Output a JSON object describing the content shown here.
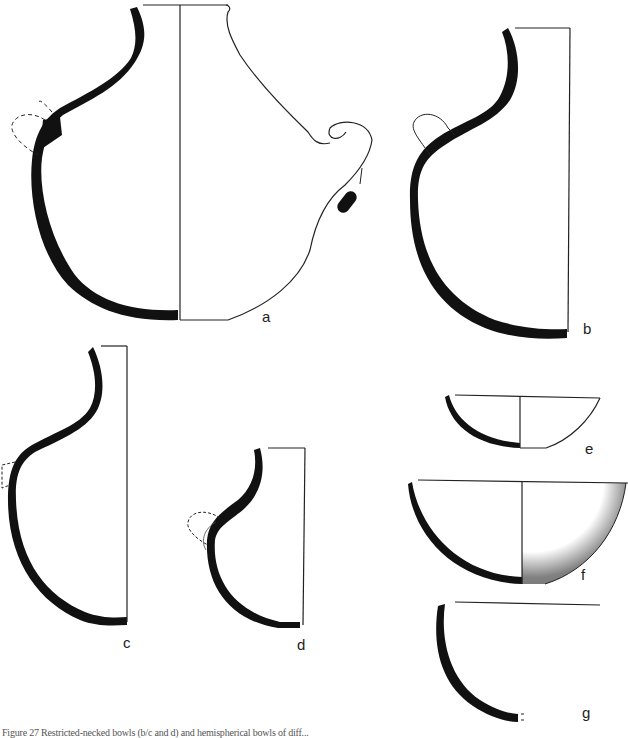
{
  "figure": {
    "caption": "Figure 27 Restricted-necked bowls (b/c and d) and hemispherical bowls of diff...",
    "vessels": [
      {
        "id": "a",
        "label": "a",
        "type": "globular jar with side handle and spout"
      },
      {
        "id": "b",
        "label": "b",
        "type": "restricted-neck vessel with lug handle"
      },
      {
        "id": "c",
        "label": "c",
        "type": "restricted-neck vessel"
      },
      {
        "id": "d",
        "label": "d",
        "type": "small restricted-neck vessel with lug"
      },
      {
        "id": "e",
        "label": "e",
        "type": "shallow bowl"
      },
      {
        "id": "f",
        "label": "f",
        "type": "hemispherical bowl, stippled exterior"
      },
      {
        "id": "g",
        "label": "g",
        "type": "deep bowl profile"
      }
    ]
  },
  "colors": {
    "ink": "#111111",
    "paper": "#ffffff"
  }
}
